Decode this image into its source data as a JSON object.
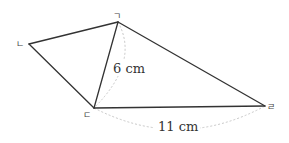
{
  "diagram": {
    "vertices": {
      "g": {
        "label": "ㄱ",
        "x": 118,
        "y": 22
      },
      "n": {
        "label": "ㄴ",
        "x": 29,
        "y": 44
      },
      "d": {
        "label": "ㄷ",
        "x": 94,
        "y": 108
      },
      "r": {
        "label": "ㄹ",
        "x": 265,
        "y": 106
      }
    },
    "edges": [
      {
        "from": "ㄱ",
        "to": "ㄴ"
      },
      {
        "from": "ㄴ",
        "to": "ㄷ"
      },
      {
        "from": "ㄷ",
        "to": "ㄹ"
      },
      {
        "from": "ㄹ",
        "to": "ㄱ"
      },
      {
        "from": "ㄱ",
        "to": "ㄷ",
        "note": "diagonal"
      }
    ],
    "measurements": {
      "diagonal_gd": "6 cm",
      "side_dr": "11 cm"
    },
    "colors": {
      "edge": "#333333",
      "dimension_arc": "#c8c8c8",
      "text": "#333333"
    }
  }
}
